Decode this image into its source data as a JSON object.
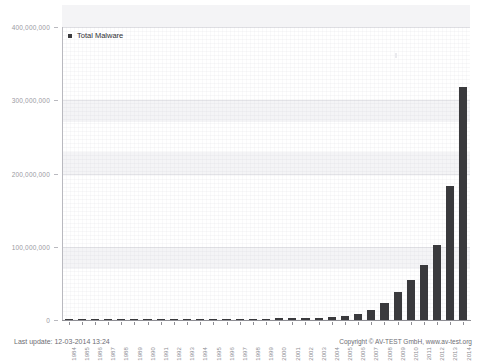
{
  "top_strip": {
    "ghost_text": " "
  },
  "legend": {
    "entries": [
      {
        "label": "Total Malware",
        "color": "#3a3a3d",
        "marker": "square-marker-icon"
      }
    ]
  },
  "footer": {
    "last_update": "Last update: 12-03-2014 13:24",
    "copyright": "Copyright © AV-TEST GmbH, www.av-test.org"
  },
  "colors": {
    "bar": "#3a3a3d",
    "axis": "#8e8e94",
    "gridline": "#e3e3e7",
    "band": "#f4f4f6",
    "tick_label": "#9a9a9f",
    "footer_text": "#6d6d73"
  },
  "chart_data": {
    "type": "bar",
    "title": "",
    "xlabel": "",
    "ylabel": "",
    "ylim": [
      0,
      400000000
    ],
    "yticks": [
      0,
      100000000,
      200000000,
      300000000,
      400000000
    ],
    "ytick_labels": [
      "0",
      "100,000,000",
      "200,000,000",
      "300,000,000",
      "400,000,000"
    ],
    "grid": true,
    "legend_position": "top-left",
    "categories": [
      "1984",
      "1985",
      "1986",
      "1987",
      "1988",
      "1989",
      "1990",
      "1991",
      "1992",
      "1993",
      "1994",
      "1995",
      "1996",
      "1997",
      "1998",
      "1999",
      "2000",
      "2001",
      "2002",
      "2003",
      "2004",
      "2005",
      "2006",
      "2007",
      "2008",
      "2009",
      "2010",
      "2011",
      "2012",
      "2013",
      "2014"
    ],
    "series": [
      {
        "name": "Total Malware",
        "color": "#3a3a3d",
        "values": [
          0,
          100000,
          200000,
          300000,
          400000,
          500000,
          600000,
          700000,
          800000,
          900000,
          1000000,
          1200000,
          1400000,
          1600000,
          1800000,
          2000000,
          2200000,
          2500000,
          2800000,
          3200000,
          3800000,
          5000000,
          8000000,
          14000000,
          23000000,
          38000000,
          55000000,
          75000000,
          103000000,
          183000000,
          318000000
        ]
      }
    ]
  }
}
